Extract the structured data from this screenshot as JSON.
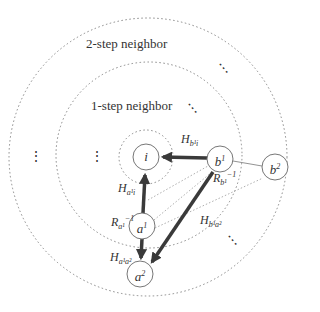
{
  "diagram": {
    "type": "neighborhood-graph",
    "rings": [
      {
        "id": "inner",
        "label": ""
      },
      {
        "id": "one-step",
        "label": "1-step neighbor"
      },
      {
        "id": "two-step",
        "label": "2-step neighbor"
      }
    ],
    "nodes": {
      "i": {
        "base": "i",
        "sup": ""
      },
      "b1": {
        "base": "b",
        "sup": "1"
      },
      "b2": {
        "base": "b",
        "sup": "2"
      },
      "a1": {
        "base": "a",
        "sup": "1"
      },
      "a2": {
        "base": "a",
        "sup": "2"
      }
    },
    "edge_labels": {
      "H_b1_i": {
        "base": "H",
        "sub": "b¹i"
      },
      "H_a1_i": {
        "base": "H",
        "sub": "a¹i"
      },
      "R_b1": {
        "base": "R",
        "sub": "b¹",
        "sup": "−1"
      },
      "R_a1": {
        "base": "R",
        "sub": "a¹",
        "sup": "−1"
      },
      "H_b1_a2": {
        "base": "H",
        "sub": "b¹a²"
      },
      "H_a1_a2": {
        "base": "H",
        "sub": "a¹a²"
      }
    },
    "ellipsis": "⋮",
    "colors": {
      "edge": "#3a3a3a",
      "ring": "#888888",
      "node_stroke": "#777777",
      "text": "#333333"
    }
  }
}
